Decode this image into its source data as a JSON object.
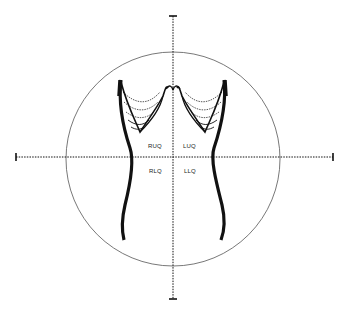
{
  "diagram": {
    "type": "abdominal-quadrants",
    "quadrants": [
      {
        "id": "ruq",
        "label": "RUQ",
        "x": 148,
        "y": 146
      },
      {
        "id": "luq",
        "label": "LUQ",
        "x": 183,
        "y": 146
      },
      {
        "id": "rlq",
        "label": "RLQ",
        "x": 149,
        "y": 171
      },
      {
        "id": "llq",
        "label": "LLQ",
        "x": 184,
        "y": 171
      }
    ],
    "circle": {
      "cx": 173,
      "cy": 159,
      "r": 107
    },
    "axes": {
      "vertical": {
        "x": 173,
        "y1": 16,
        "y2": 299
      },
      "horizontal": {
        "y": 157,
        "x1": 16,
        "x2": 333
      }
    },
    "colors": {
      "ink": "#111111",
      "circle": "#555555",
      "background": "#ffffff"
    }
  }
}
